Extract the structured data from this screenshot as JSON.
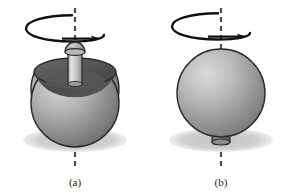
{
  "figure": {
    "background_color": "#ffffff",
    "type": "physics-illustration",
    "panels": [
      {
        "id": "a",
        "label": "(a)",
        "state": "upright-stem-up",
        "center_x": 75,
        "sphere_cx": 75,
        "sphere_cy": 103,
        "sphere_r": 44,
        "axis_top_y": 8,
        "axis_bottom_y": 166,
        "shadow_cx": 75,
        "shadow_cy": 140,
        "shadow_rx": 52,
        "shadow_ry": 12,
        "spin_arrow": {
          "cx": 72,
          "cy": 28,
          "rx": 46,
          "ry": 13,
          "direction": "clockwise-from-above"
        },
        "stem": {
          "position": "top",
          "x": 68,
          "y": 52,
          "width": 14,
          "height": 32,
          "knob": true,
          "knob_cx": 75,
          "knob_cy": 50,
          "knob_r": 10
        },
        "cavity": {
          "cx": 75,
          "cy": 72,
          "rx": 41,
          "ry": 14
        },
        "label_x": 75,
        "label_y": 186
      },
      {
        "id": "b",
        "label": "(b)",
        "state": "inverted-stem-down",
        "center_x": 221,
        "sphere_cx": 221,
        "sphere_cy": 93,
        "sphere_r": 44,
        "axis_top_y": 8,
        "axis_bottom_y": 166,
        "shadow_cx": 221,
        "shadow_cy": 140,
        "shadow_rx": 52,
        "shadow_ry": 12,
        "spin_arrow": {
          "cx": 218,
          "cy": 26,
          "rx": 46,
          "ry": 13,
          "direction": "clockwise-from-above"
        },
        "stem": {
          "position": "bottom",
          "x": 212,
          "y": 131,
          "width": 18,
          "height": 14,
          "knob": false
        },
        "label_x": 221,
        "label_y": 186
      }
    ],
    "colors": {
      "sphere_highlight": "#d2d2d2",
      "sphere_mid": "#a8a8a8",
      "sphere_shade": "#7e7e7e",
      "sphere_dark": "#6a6a6a",
      "cavity_dark": "#4a4a4a",
      "cavity_mid": "#5e5e5e",
      "stem_light": "#d8d8d8",
      "stem_mid": "#b0b0b0",
      "stem_dark": "#8a8a8a",
      "shadow": "#cfcfcf",
      "outline": "#2b2b2b",
      "axis": "#4d4d4d",
      "arrow": "#111111",
      "label_text": "#1a1a1a"
    }
  }
}
